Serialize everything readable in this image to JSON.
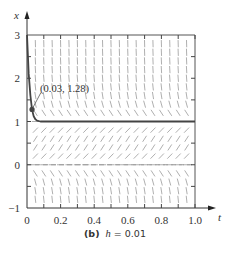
{
  "chart_data": {
    "type": "line",
    "title": "",
    "caption": {
      "label": "(b)",
      "variable": "h",
      "equals": "= 0.01"
    },
    "xlabel": "t",
    "ylabel": "x",
    "xlim": [
      0,
      1.0
    ],
    "ylim": [
      -1,
      3
    ],
    "xticks": [
      0,
      0.2,
      0.4,
      0.6,
      0.8,
      1.0
    ],
    "xtick_labels": [
      "0",
      "0.2",
      "0.4",
      "0.6",
      "0.8",
      "1.0"
    ],
    "yticks": [
      -1,
      0,
      1,
      2,
      3
    ],
    "ytick_labels": [
      "−1",
      "0",
      "1",
      "2",
      "3"
    ],
    "grid": false,
    "direction_field": {
      "equation": "logistic-type: x' = k x (1 - x)",
      "t_step": 0.05,
      "x_step": 0.2,
      "equilibria": [
        0,
        1
      ]
    },
    "series": [
      {
        "name": "Euler approximation h = 0.01",
        "x": [
          0,
          0.01,
          0.02,
          0.03,
          0.04,
          0.05,
          0.06,
          0.08,
          0.1,
          0.2,
          0.4,
          0.6,
          0.8,
          1.0
        ],
        "y": [
          3.0,
          2.1,
          1.6,
          1.28,
          1.12,
          1.05,
          1.02,
          1.0,
          1.0,
          1.0,
          1.0,
          1.0,
          1.0,
          1.0
        ]
      }
    ],
    "annotations": [
      {
        "text": "(0.03, 1.28)",
        "point": [
          0.03,
          1.28
        ]
      }
    ]
  }
}
